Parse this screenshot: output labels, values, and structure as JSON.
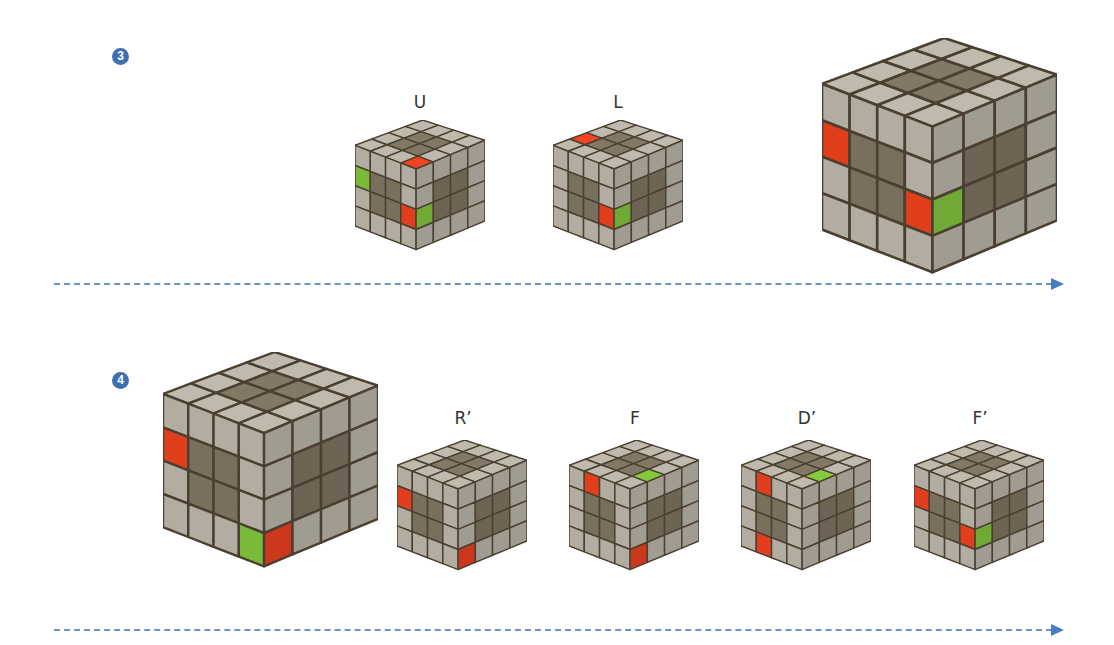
{
  "colors": {
    "badge": "#3e6fb5",
    "arrow": "#4a7cc4",
    "sticker_gray": "#b7b1a6",
    "sticker_dark": "#7d7260",
    "red": "#e8401f",
    "green": "#7fc03a",
    "edge": "#4a3f30"
  },
  "steps": [
    {
      "number": "3",
      "badge_pos": [
        112,
        48
      ],
      "arrow": {
        "x": 54,
        "y": 278,
        "width": 1010
      },
      "cubes": [
        {
          "label": "U",
          "x": 355,
          "y": 120,
          "size": 130,
          "top": [
            "GGGG",
            "GDDG",
            "GDDG",
            "RGGG"
          ],
          "front": [
            "GGGG",
            "NDDG",
            "GDDR",
            "GGGG"
          ],
          "right": [
            "GGGG",
            "GDDG",
            "NDDG",
            "GGGG"
          ]
        },
        {
          "label": "L",
          "x": 553,
          "y": 120,
          "size": 130,
          "top": [
            "GRGG",
            "GDDG",
            "GDDG",
            "GGGG"
          ],
          "front": [
            "GGGG",
            "GDDG",
            "GDDR",
            "GGGG"
          ],
          "right": [
            "GGGG",
            "GDDG",
            "NDDG",
            "GGGG"
          ]
        },
        {
          "label": "",
          "x": 822,
          "y": 38,
          "size": 235,
          "top": [
            "GGGG",
            "GDDG",
            "GDDG",
            "GGGG"
          ],
          "front": [
            "GGGG",
            "RDDG",
            "GDDR",
            "GGGG"
          ],
          "right": [
            "GGGG",
            "GDDG",
            "NDDG",
            "GGGG"
          ]
        }
      ]
    },
    {
      "number": "4",
      "badge_pos": [
        112,
        372
      ],
      "arrow": {
        "x": 54,
        "y": 624,
        "width": 1010
      },
      "cubes": [
        {
          "label": "",
          "x": 163,
          "y": 352,
          "size": 215,
          "top": [
            "GGGG",
            "GDDG",
            "GDDG",
            "GGGG"
          ],
          "front": [
            "GGGG",
            "RDDG",
            "GDDG",
            "GGGN"
          ],
          "right": [
            "GGGG",
            "GDDG",
            "GDDG",
            "RGGG"
          ]
        },
        {
          "label": "R’",
          "x": 397,
          "y": 440,
          "size": 130,
          "top": [
            "GGGG",
            "GDDG",
            "GDDG",
            "GGGG"
          ],
          "front": [
            "GGGG",
            "RDDG",
            "GDDG",
            "GGGG"
          ],
          "right": [
            "GGGG",
            "GDDG",
            "GDDG",
            "RGGG"
          ]
        },
        {
          "label": "F",
          "x": 569,
          "y": 440,
          "size": 130,
          "top": [
            "GGGG",
            "GDDG",
            "GDDG",
            "GNGG"
          ],
          "front": [
            "GRGG",
            "GDDG",
            "GDDG",
            "GGGG"
          ],
          "right": [
            "GGGG",
            "GDDG",
            "GDDG",
            "RGGG"
          ]
        },
        {
          "label": "D’",
          "x": 741,
          "y": 440,
          "size": 130,
          "top": [
            "GGGG",
            "GDDG",
            "GDDG",
            "GNGG"
          ],
          "front": [
            "GRGG",
            "GDDG",
            "GDDG",
            "GRGG"
          ],
          "right": [
            "GGGG",
            "GDDG",
            "GDDG",
            "GGGG"
          ]
        },
        {
          "label": "F’",
          "x": 914,
          "y": 440,
          "size": 130,
          "top": [
            "GGGG",
            "GDDG",
            "GDDG",
            "GGGG"
          ],
          "front": [
            "GGGG",
            "RDDG",
            "GDDR",
            "GGGG"
          ],
          "right": [
            "GGGG",
            "GDDG",
            "NDDG",
            "GGGG"
          ]
        }
      ]
    }
  ]
}
